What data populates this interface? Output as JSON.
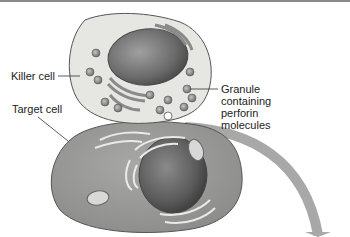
{
  "diagram": {
    "labels": {
      "killer_cell": "Killer cell",
      "target_cell": "Target cell",
      "granule_line1": "Granule",
      "granule_line2": "containing",
      "granule_line3": "perforin",
      "granule_line4": "molecules"
    },
    "colors": {
      "killer_cytoplasm": "#e6e6e3",
      "killer_nucleus": "#6e6e6e",
      "target_cytoplasm": "#9a9a98",
      "target_nucleus": "#5a5a5a",
      "granule": "#8c8c8c",
      "arrow": "#a8a8a8",
      "outline": "#555555"
    }
  }
}
